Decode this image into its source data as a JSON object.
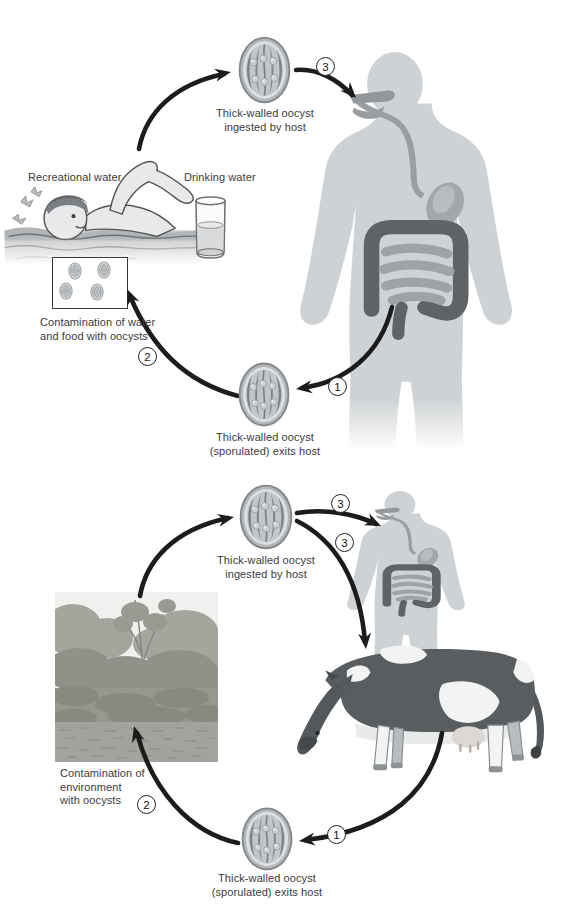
{
  "diagram_title": "Oocyst transmission life cycles (human cycle and cattle cycle)",
  "colors": {
    "background": "#ffffff",
    "arrow": "#1c1c1c",
    "human_silhouette": "#cfd2d4",
    "digestive_light": "#9fa2a5",
    "digestive_dark": "#606366",
    "cow_body": "#595d60",
    "oocyst_wall": "#8f9295",
    "text": "#3b3b3b"
  },
  "top_cycle": {
    "oocyst_ingested": {
      "line1": "Thick-walled oocyst",
      "line2": "ingested by host"
    },
    "oocyst_exits": {
      "line1": "Thick-walled oocyst",
      "line2": "(sporulated) exits host"
    },
    "recreational_water": "Recreational water",
    "drinking_water": "Drinking water",
    "contamination": {
      "line1": "Contamination of water",
      "line2": "and food with oocysts"
    },
    "steps": {
      "exit": "1",
      "contaminate": "2",
      "ingest": "3"
    }
  },
  "bottom_cycle": {
    "oocyst_ingested": {
      "line1": "Thick-walled oocyst",
      "line2": "ingested by host"
    },
    "oocyst_exits": {
      "line1": "Thick-walled oocyst",
      "line2": "(sporulated) exits host"
    },
    "contamination": {
      "line1": "Contamination of",
      "line2": "environment",
      "line3": "with oocysts"
    },
    "steps": {
      "exit": "1",
      "contaminate": "2",
      "ingest_human": "3",
      "ingest_cow": "3"
    }
  }
}
